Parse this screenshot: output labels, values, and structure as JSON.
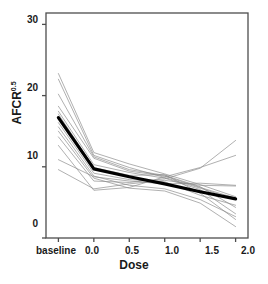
{
  "chart_data": {
    "type": "line",
    "title": "",
    "xlabel": "Dose",
    "ylabel": "AFCR",
    "ylabel_sup": "0.5",
    "categories": [
      "baseline",
      "0.0",
      "0.5",
      "1.0",
      "1.5",
      "2.0"
    ],
    "x": [
      0,
      1,
      2,
      3,
      4,
      5
    ],
    "xtick_labels": [
      "baseline",
      "0.0",
      "0.5",
      "1.0",
      "1.5",
      "2.0"
    ],
    "ytick_labels": [
      "0",
      "10",
      "20",
      "30"
    ],
    "ylim": [
      0,
      31.6
    ],
    "xlim": [
      -0.35,
      5.35
    ],
    "grid": false,
    "legend": false,
    "series": [
      {
        "name": "mean",
        "emphasis": "bold",
        "color": "#000000",
        "width": 3.2,
        "values": [
          16.9,
          9.7,
          8.6,
          7.6,
          6.5,
          5.5
        ]
      },
      {
        "name": "subject-01",
        "emphasis": "normal",
        "color": "#8a8a8a",
        "width": 0.8,
        "values": [
          23.1,
          12.0,
          10.4,
          9.0,
          7.5,
          5.8
        ]
      },
      {
        "name": "subject-02",
        "emphasis": "normal",
        "color": "#8a8a8a",
        "width": 0.8,
        "values": [
          22.3,
          11.6,
          9.9,
          8.5,
          7.0,
          5.4
        ]
      },
      {
        "name": "subject-03",
        "emphasis": "normal",
        "color": "#8a8a8a",
        "width": 0.8,
        "values": [
          20.2,
          11.4,
          9.6,
          8.8,
          7.2,
          4.3
        ]
      },
      {
        "name": "subject-04",
        "emphasis": "normal",
        "color": "#8a8a8a",
        "width": 0.8,
        "values": [
          18.5,
          11.2,
          9.4,
          8.7,
          7.1,
          5.6
        ]
      },
      {
        "name": "subject-05",
        "emphasis": "normal",
        "color": "#8a8a8a",
        "width": 0.8,
        "values": [
          17.8,
          10.3,
          9.2,
          8.4,
          6.8,
          3.4
        ]
      },
      {
        "name": "subject-06",
        "emphasis": "normal",
        "color": "#8a8a8a",
        "width": 0.8,
        "values": [
          17.4,
          9.9,
          8.8,
          8.9,
          6.3,
          2.6
        ]
      },
      {
        "name": "subject-07",
        "emphasis": "normal",
        "color": "#8a8a8a",
        "width": 0.8,
        "values": [
          16.2,
          9.1,
          8.2,
          7.9,
          6.0,
          4.6
        ]
      },
      {
        "name": "subject-08",
        "emphasis": "normal",
        "color": "#8a8a8a",
        "width": 0.8,
        "values": [
          15.6,
          8.7,
          7.4,
          6.9,
          5.4,
          3.0
        ]
      },
      {
        "name": "subject-09",
        "emphasis": "normal",
        "color": "#8a8a8a",
        "width": 0.8,
        "values": [
          15.0,
          8.4,
          7.0,
          6.6,
          4.9,
          1.6
        ]
      },
      {
        "name": "subject-10",
        "emphasis": "normal",
        "color": "#8a8a8a",
        "width": 0.8,
        "values": [
          14.2,
          8.0,
          7.8,
          8.3,
          9.8,
          13.7
        ]
      },
      {
        "name": "subject-11",
        "emphasis": "normal",
        "color": "#8a8a8a",
        "width": 0.8,
        "values": [
          13.0,
          6.7,
          7.1,
          8.6,
          9.9,
          11.6
        ]
      },
      {
        "name": "subject-12",
        "emphasis": "normal",
        "color": "#8a8a8a",
        "width": 0.8,
        "values": [
          11.0,
          8.6,
          8.0,
          7.6,
          7.7,
          7.4
        ]
      },
      {
        "name": "subject-13",
        "emphasis": "normal",
        "color": "#8a8a8a",
        "width": 0.8,
        "values": [
          9.6,
          6.9,
          7.6,
          8.1,
          7.4,
          7.3
        ]
      }
    ]
  },
  "axes": {
    "y_ticks": [
      {
        "label": "0",
        "value": 0
      },
      {
        "label": "10",
        "value": 10
      },
      {
        "label": "20",
        "value": 20
      },
      {
        "label": "30",
        "value": 30
      }
    ],
    "x_ticks": [
      {
        "label": "baseline",
        "value": 0
      },
      {
        "label": "0.0",
        "value": 1
      },
      {
        "label": "0.5",
        "value": 2
      },
      {
        "label": "1.0",
        "value": 3
      },
      {
        "label": "1.5",
        "value": 4
      },
      {
        "label": "2.0",
        "value": 5
      }
    ],
    "frame_color": "#4d4d4d",
    "text_color": "#1a1a1a"
  }
}
